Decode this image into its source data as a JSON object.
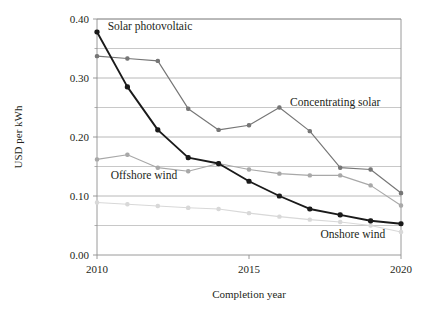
{
  "chart_data": {
    "type": "line",
    "title": "",
    "xlabel": "Completion year",
    "ylabel": "USD per kWh",
    "x": [
      2010,
      2011,
      2012,
      2013,
      2014,
      2015,
      2016,
      2017,
      2018,
      2019,
      2020
    ],
    "xlim": [
      2010,
      2020
    ],
    "ylim": [
      0.0,
      0.4
    ],
    "xticks": [
      "2010",
      "2015",
      "2020"
    ],
    "xtick_values": [
      2010,
      2015,
      2020
    ],
    "yticks": [
      "0.00",
      "0.10",
      "0.20",
      "0.30",
      "0.40"
    ],
    "ytick_values": [
      0.0,
      0.1,
      0.2,
      0.3,
      0.4
    ],
    "minor_gridlines": [
      0.05,
      0.15,
      0.25,
      0.35
    ],
    "grid": true,
    "legend": "inline-annotations",
    "series": [
      {
        "name": "Solar photovoltaic",
        "color": "#1a1a1a",
        "values": [
          0.378,
          0.285,
          0.212,
          0.165,
          0.155,
          0.125,
          0.1,
          0.078,
          0.068,
          0.058,
          0.053
        ]
      },
      {
        "name": "Concentrating solar",
        "color": "#767676",
        "values": [
          0.337,
          0.333,
          0.329,
          0.248,
          0.212,
          0.22,
          0.25,
          0.21,
          0.148,
          0.145,
          0.105
        ]
      },
      {
        "name": "Offshore wind",
        "color": "#a8a8a8",
        "values": [
          0.162,
          0.17,
          0.148,
          0.142,
          0.155,
          0.145,
          0.138,
          0.135,
          0.135,
          0.118,
          0.084
        ]
      },
      {
        "name": "Onshore wind",
        "color": "#d8d8d8",
        "values": [
          0.089,
          0.086,
          0.083,
          0.08,
          0.078,
          0.071,
          0.065,
          0.06,
          0.056,
          0.05,
          0.039
        ]
      }
    ],
    "annotations": [
      {
        "text": "Solar photovoltaic",
        "x": 2010.35,
        "y": 0.382,
        "anchor": "start"
      },
      {
        "text": "Concentrating solar",
        "x": 2016.35,
        "y": 0.252,
        "anchor": "start"
      },
      {
        "text": "Offshore wind",
        "x": 2010.45,
        "y": 0.128,
        "anchor": "start"
      },
      {
        "text": "Onshore wind",
        "x": 2017.35,
        "y": 0.028,
        "anchor": "start"
      }
    ],
    "axis_color": "#8f8f8f",
    "grid_color": "#b0b0b0"
  }
}
